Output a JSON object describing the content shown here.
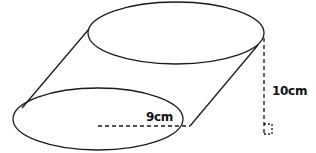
{
  "diagram": {
    "type": "oblique-cylinder",
    "radius_label": "9cm",
    "height_label": "10cm",
    "stroke_color": "#1a1a1a",
    "background": "#ffffff"
  }
}
